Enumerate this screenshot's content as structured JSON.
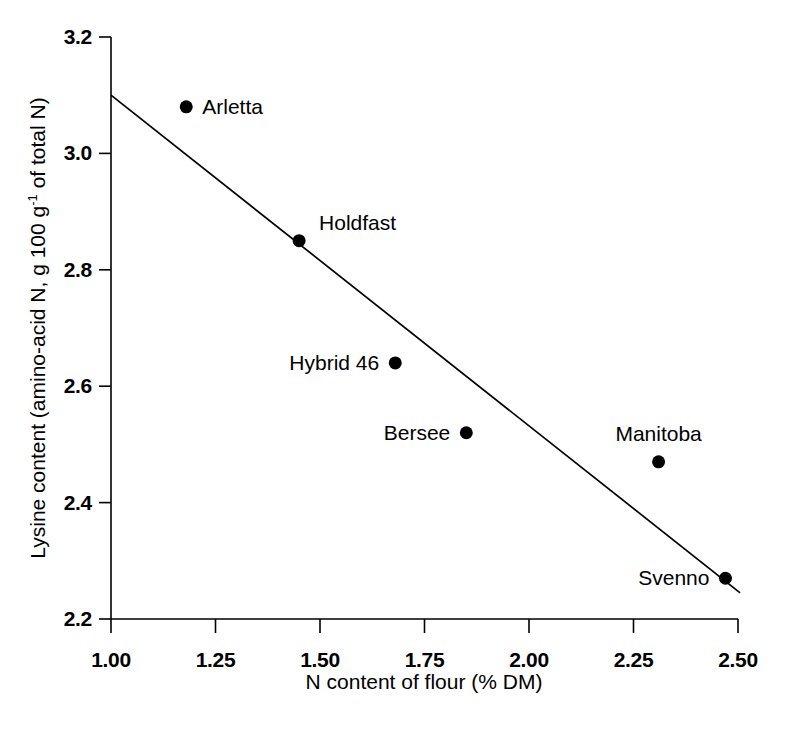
{
  "chart_data": {
    "type": "scatter",
    "title": "",
    "xlabel": "N content of flour (% DM)",
    "ylabel_prefix": "Lysine content (amino-acid N, g 100 g",
    "ylabel_exponent": "-1",
    "ylabel_suffix": " of total N)",
    "ylabel_plain": "Lysine content (amino-acid N, g 100 g-1 of total N)",
    "xlim": [
      1.0,
      2.5
    ],
    "ylim": [
      2.2,
      3.2
    ],
    "xticks": [
      "1.00",
      "1.25",
      "1.50",
      "1.75",
      "2.00",
      "2.25",
      "2.50"
    ],
    "xtick_values": [
      1.0,
      1.25,
      1.5,
      1.75,
      2.0,
      2.25,
      2.5
    ],
    "yticks": [
      "2.2",
      "2.4",
      "2.6",
      "2.8",
      "3.0",
      "3.2"
    ],
    "ytick_values": [
      2.2,
      2.4,
      2.6,
      2.8,
      3.0,
      3.2
    ],
    "grid": false,
    "legend": "none",
    "points": [
      {
        "label": "Arletta",
        "x": 1.18,
        "y": 3.08,
        "label_side": "right"
      },
      {
        "label": "Holdfast",
        "x": 1.45,
        "y": 2.85,
        "label_side": "upper-right"
      },
      {
        "label": "Hybrid 46",
        "x": 1.68,
        "y": 2.64,
        "label_side": "left"
      },
      {
        "label": "Bersee",
        "x": 1.85,
        "y": 2.52,
        "label_side": "left"
      },
      {
        "label": "Manitoba",
        "x": 2.31,
        "y": 2.47,
        "label_side": "above"
      },
      {
        "label": "Svenno",
        "x": 2.47,
        "y": 2.27,
        "label_side": "left"
      }
    ],
    "trendline": {
      "type": "linear-fit",
      "x_start": 1.0,
      "y_start": 3.1,
      "x_end": 2.505,
      "y_end": 2.245
    },
    "marker": {
      "shape": "filled-circle",
      "color": "#000000",
      "size_px": 13
    },
    "axis_color": "#000000"
  }
}
